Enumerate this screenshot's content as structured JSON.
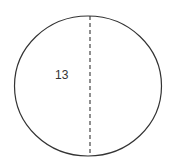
{
  "diagram": {
    "shape": "circle",
    "line": "diameter (dashed)",
    "label": "13",
    "stroke_color": "#333333"
  }
}
